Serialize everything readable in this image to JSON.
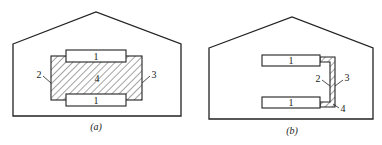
{
  "figure": {
    "panels": [
      {
        "id": "a",
        "caption": "(a)",
        "labels": {
          "top_unit": "1",
          "bottom_unit": "1",
          "left_boundary": "2",
          "right_boundary": "3",
          "hatched_region": "4"
        }
      },
      {
        "id": "b",
        "caption": "(b)",
        "labels": {
          "top_unit": "1",
          "bottom_unit": "1",
          "inner_boundary": "2",
          "outer_boundary": "3",
          "hatched_region": "4"
        }
      }
    ],
    "colors": {
      "stroke": "#222222",
      "background": "#ffffff"
    }
  }
}
